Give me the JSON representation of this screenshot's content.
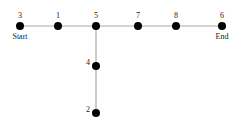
{
  "diagram": {
    "type": "graph",
    "edge_color": "#aaaaaa",
    "node_color": "#000000",
    "nodes": [
      {
        "id": "3",
        "label": "3",
        "x": 20,
        "y": 26,
        "tag": "Start"
      },
      {
        "id": "1",
        "label": "1",
        "x": 58,
        "y": 26,
        "tag": ""
      },
      {
        "id": "5",
        "label": "5",
        "x": 96,
        "y": 26,
        "tag": ""
      },
      {
        "id": "7",
        "label": "7",
        "x": 138,
        "y": 26,
        "tag": ""
      },
      {
        "id": "8",
        "label": "8",
        "x": 176,
        "y": 26,
        "tag": ""
      },
      {
        "id": "6",
        "label": "6",
        "x": 222,
        "y": 26,
        "tag": "End"
      },
      {
        "id": "4",
        "label": "4",
        "x": 96,
        "y": 66,
        "tag": ""
      },
      {
        "id": "2",
        "label": "2",
        "x": 96,
        "y": 113,
        "tag": ""
      }
    ],
    "edges": [
      [
        "3",
        "1"
      ],
      [
        "1",
        "5"
      ],
      [
        "5",
        "7"
      ],
      [
        "7",
        "8"
      ],
      [
        "8",
        "6"
      ],
      [
        "5",
        "4"
      ],
      [
        "4",
        "2"
      ]
    ]
  }
}
